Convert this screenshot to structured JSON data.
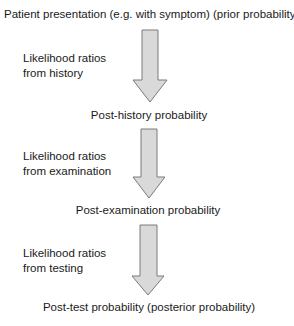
{
  "diagram": {
    "title": "Patient presentation (e.g. with symptom) (prior probability)",
    "steps": [
      {
        "label_line1": "Likelihood ratios",
        "label_line2": "from history",
        "result": "Post-history probability"
      },
      {
        "label_line1": "Likelihood ratios",
        "label_line2": "from examination",
        "result": "Post-examination probability"
      },
      {
        "label_line1": "Likelihood ratios",
        "label_line2": "from testing",
        "result": "Post-test probability (posterior probability)"
      }
    ],
    "colors": {
      "arrow_fill": "#d9d9d9",
      "arrow_stroke": "#7a7a7a",
      "text": "#1a1a1a"
    }
  }
}
